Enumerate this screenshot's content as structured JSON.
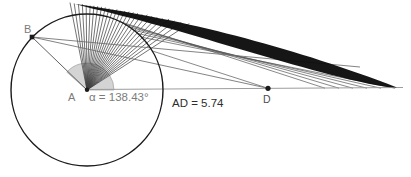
{
  "figure": {
    "type": "geometry-construction",
    "labels": {
      "point_a": "A",
      "point_b": "B",
      "point_d": "D",
      "angle": "α = 138.43°",
      "distance": "AD = 5.74"
    },
    "values": {
      "alpha_degrees": 138.43,
      "ad_length": 5.74
    },
    "colors": {
      "background": "#ffffff",
      "circle": "#1a1a1a",
      "axis_line": "#9c9c9c",
      "fan_rays": "#414141",
      "trace_band": "#0d0d0d",
      "under_lines": "#525252",
      "segment_ab": "#606060",
      "segment_b_lines": "#6e6e6e",
      "sector_fill": "#cdcdcd",
      "sector_edge": "#999999",
      "label_gray": "#7b7b7b",
      "label_dark": "#2d2d2d",
      "label_d": "#4c4c4c",
      "marker": "#1b1b1b"
    },
    "geometry": {
      "width": 411,
      "height": 177,
      "circle": {
        "cx": 87,
        "cy": 90,
        "r": 76
      },
      "point_b": {
        "x": 32,
        "y": 37
      },
      "point_d": {
        "x": 268,
        "y": 88.3
      },
      "axis": {
        "x1": 87,
        "y1": 89.5,
        "x2": 403,
        "y2": 87.5
      },
      "sector": {
        "radius": 27,
        "start_deg": 0,
        "end_deg": 138.43
      },
      "envelope_curve": {
        "x0": 75,
        "x1": 397,
        "y0": 4,
        "a": 0.1364,
        "b": 0.0003805
      },
      "band": {
        "max_width": 18,
        "skew": 0.7
      },
      "fan": {
        "theta_min_deg": 33,
        "theta_max_deg": 101,
        "count": 27
      },
      "under_lines": {
        "count": 6,
        "theta_start_deg": 44,
        "theta_step_deg": 4,
        "end_x_start": 395,
        "end_x_step": -14,
        "end_y": 88.2
      },
      "extra_under_line": {
        "theta_deg": 31
      },
      "b_line_ends": [
        {
          "x": 360,
          "y": 67
        }
      ]
    }
  }
}
